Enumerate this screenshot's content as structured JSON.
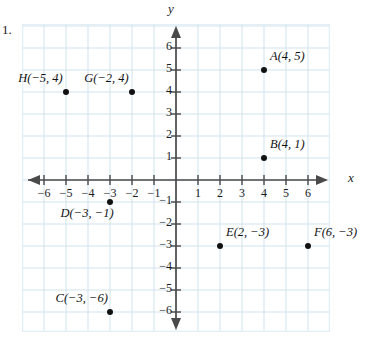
{
  "page": {
    "cut_off_header": "",
    "problem_number": "1."
  },
  "chart_data": {
    "type": "scatter",
    "title": "",
    "xlabel": "x",
    "ylabel": "y",
    "xlim": [
      -7,
      7
    ],
    "ylim": [
      -7,
      7
    ],
    "grid": true,
    "legend": "none",
    "x_ticks": [
      "-6",
      "-5",
      "-4",
      "-3",
      "-2",
      "-1",
      "1",
      "2",
      "3",
      "4",
      "5",
      "6"
    ],
    "x_tick_values": [
      -6,
      -5,
      -4,
      -3,
      -2,
      -1,
      1,
      2,
      3,
      4,
      5,
      6
    ],
    "y_ticks": [
      "6",
      "5",
      "4",
      "3",
      "2",
      "1",
      "-1",
      "-2",
      "-3",
      "-4",
      "-5",
      "-6"
    ],
    "y_tick_values": [
      6,
      5,
      4,
      3,
      2,
      1,
      -1,
      -2,
      -3,
      -4,
      -5,
      -6
    ],
    "points": [
      {
        "name": "A",
        "x": 4,
        "y": 5,
        "label": "A(4, 5)",
        "label_pos": "right-above"
      },
      {
        "name": "B",
        "x": 4,
        "y": 1,
        "label": "B(4, 1)",
        "label_pos": "right-above"
      },
      {
        "name": "C",
        "x": -3,
        "y": -6,
        "label": "C(−3, −6)",
        "label_pos": "left-above"
      },
      {
        "name": "D",
        "x": -3,
        "y": -1,
        "label": "D(−3, −1)",
        "label_pos": "left-below"
      },
      {
        "name": "E",
        "x": 2,
        "y": -3,
        "label": "E(2, −3)",
        "label_pos": "right-above"
      },
      {
        "name": "F",
        "x": 6,
        "y": -3,
        "label": "F(6, −3)",
        "label_pos": "right-above"
      },
      {
        "name": "G",
        "x": -2,
        "y": 4,
        "label": "G(−2, 4)",
        "label_pos": "left-above"
      },
      {
        "name": "H",
        "x": -5,
        "y": 4,
        "label": "H(−5, 4)",
        "label_pos": "left-above"
      }
    ]
  },
  "colors": {
    "grid_line": "#cfe3ee",
    "plot_border": "#e3eef5",
    "axis": "#4a4a4a",
    "point": "#111111",
    "text": "#1b1b1b"
  }
}
